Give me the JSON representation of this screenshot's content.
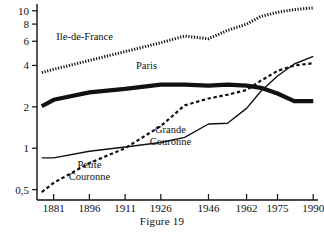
{
  "caption": "Figure 19",
  "chart_data": {
    "type": "line",
    "title": "",
    "subtitle": "",
    "xlabel": "",
    "ylabel": "",
    "yscale": "log",
    "grid": false,
    "legend_position": "inline-annotations",
    "x": [
      1876,
      1881,
      1896,
      1911,
      1926,
      1936,
      1946,
      1954,
      1962,
      1968,
      1975,
      1982,
      1990
    ],
    "xtick_labels": [
      "1881",
      "1896",
      "1911",
      "1926",
      "1946",
      "1962",
      "1975",
      "1990"
    ],
    "xtick_values": [
      1881,
      1896,
      1911,
      1926,
      1946,
      1962,
      1975,
      1990
    ],
    "ytick_labels": [
      "0,5",
      "1",
      "2",
      "4",
      "6",
      "8",
      "10"
    ],
    "ytick_values": [
      0.5,
      1,
      2,
      4,
      6,
      8,
      10
    ],
    "ylim": [
      0.42,
      11.2
    ],
    "xlim": [
      1874,
      1992
    ],
    "series": [
      {
        "name": "Ile-de-France",
        "style": "dotted-thick",
        "color": "#111111",
        "label": "Ile-de-France",
        "label_x": 1894,
        "label_y": 6.1,
        "values": [
          3.55,
          3.75,
          4.35,
          5.05,
          5.85,
          6.55,
          6.25,
          7.2,
          8.0,
          9.1,
          9.75,
          10.2,
          10.5
        ]
      },
      {
        "name": "Paris",
        "style": "solid-very-thick",
        "color": "#111111",
        "label": "Paris",
        "label_x": 1920,
        "label_y": 3.75,
        "values": [
          2.02,
          2.25,
          2.55,
          2.7,
          2.9,
          2.9,
          2.85,
          2.9,
          2.85,
          2.75,
          2.5,
          2.2,
          2.2
        ]
      },
      {
        "name": "Petite Couronne",
        "style": "dashed",
        "color": "#111111",
        "label": "Petite",
        "label2": "Couronne",
        "label_x": 1896,
        "label_y": 0.72,
        "values": [
          0.48,
          0.56,
          0.78,
          1.0,
          1.45,
          2.05,
          2.3,
          2.45,
          2.65,
          3.1,
          3.65,
          4.0,
          4.15
        ]
      },
      {
        "name": "Grande Couronne",
        "style": "solid-thin",
        "color": "#111111",
        "label": "Grande",
        "label2": "Couronne",
        "label_x": 1930,
        "label_y": 1.3,
        "values": [
          0.85,
          0.85,
          0.95,
          1.02,
          1.1,
          1.2,
          1.5,
          1.52,
          1.95,
          2.6,
          3.35,
          4.1,
          4.65
        ]
      }
    ]
  }
}
